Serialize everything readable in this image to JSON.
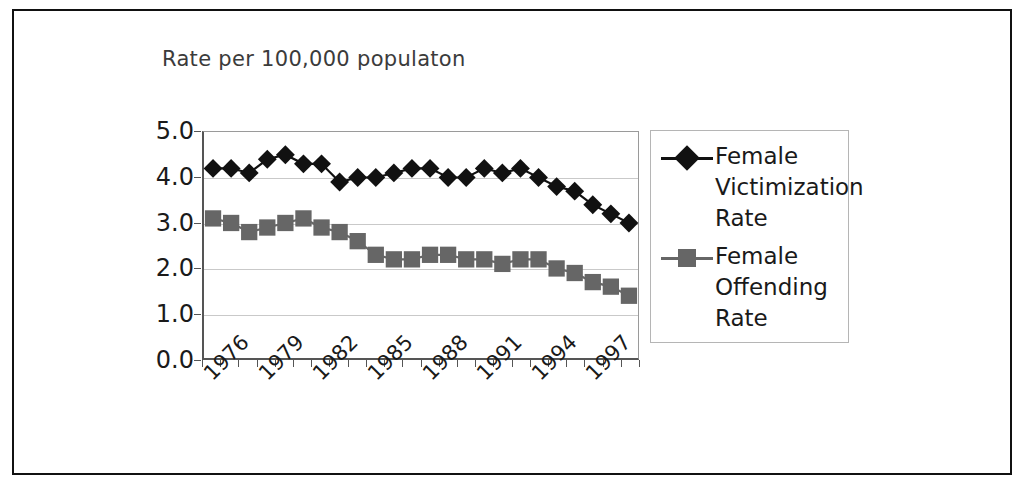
{
  "figure": {
    "title": "Rate per 100,000 populaton",
    "border_color": "#111111"
  },
  "legend": {
    "position": "right",
    "entries": [
      {
        "label": "Female Victimization Rate",
        "marker": "diamond",
        "color": "#111111"
      },
      {
        "label": "Female Offending Rate",
        "marker": "square",
        "color": "#666666"
      }
    ]
  },
  "chart_data": {
    "type": "line",
    "title": "Rate per 100,000 populaton",
    "xlabel": "",
    "ylabel": "Rate per 100,000 populaton",
    "ylim": [
      0.0,
      5.0
    ],
    "ytick_labels": [
      "0.0",
      "1.0",
      "2.0",
      "3.0",
      "4.0",
      "5.0"
    ],
    "ytick_values": [
      0.0,
      1.0,
      2.0,
      3.0,
      4.0,
      5.0
    ],
    "grid": true,
    "legend_position": "right",
    "x": [
      1976,
      1977,
      1978,
      1979,
      1980,
      1981,
      1982,
      1983,
      1984,
      1985,
      1986,
      1987,
      1988,
      1989,
      1990,
      1991,
      1992,
      1993,
      1994,
      1995,
      1996,
      1997,
      1998,
      1999
    ],
    "xtick_labels": [
      "1976",
      "1979",
      "1982",
      "1985",
      "1988",
      "1991",
      "1994",
      "1997"
    ],
    "xtick_values": [
      1976,
      1979,
      1982,
      1985,
      1988,
      1991,
      1994,
      1997
    ],
    "series": [
      {
        "name": "Female Victimization Rate",
        "marker": "diamond",
        "color": "#111111",
        "values": [
          4.2,
          4.2,
          4.1,
          4.4,
          4.5,
          4.3,
          4.3,
          3.9,
          4.0,
          4.0,
          4.1,
          4.2,
          4.2,
          4.0,
          4.0,
          4.2,
          4.1,
          4.2,
          4.0,
          3.8,
          3.7,
          3.4,
          3.2,
          3.0
        ]
      },
      {
        "name": "Female Offending Rate",
        "marker": "square",
        "color": "#666666",
        "values": [
          3.1,
          3.0,
          2.8,
          2.9,
          3.0,
          3.1,
          2.9,
          2.8,
          2.6,
          2.3,
          2.2,
          2.2,
          2.3,
          2.3,
          2.2,
          2.2,
          2.1,
          2.2,
          2.2,
          2.0,
          1.9,
          1.7,
          1.6,
          1.4
        ]
      }
    ]
  },
  "caption_partial": ""
}
